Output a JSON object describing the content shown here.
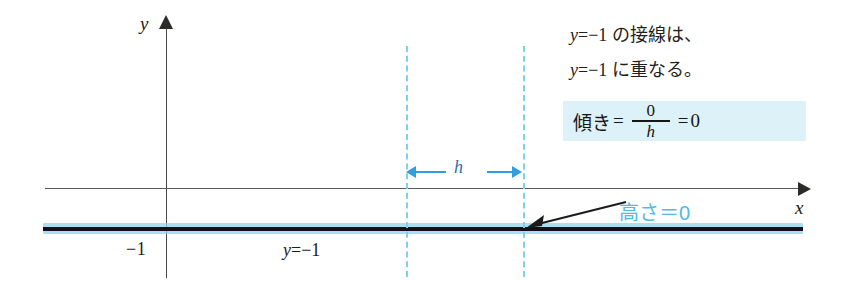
{
  "figure": {
    "axes": {
      "y_label": "y",
      "x_label": "x"
    },
    "tick_labels": {
      "minus_one": "−1"
    },
    "curve_label": {
      "var": "y",
      "rest": "=−1"
    },
    "measure": {
      "h_label": "h"
    },
    "notes": [
      {
        "var": "y",
        "rest": "=−1 の接線は、"
      },
      {
        "var": "y",
        "rest": "=−1 に重なる。"
      }
    ],
    "slope_formula": {
      "lead": "傾き",
      "equals_1": "=",
      "numerator": "0",
      "denominator": "h",
      "equals_2": "=",
      "result": "0"
    },
    "callout": {
      "height_zero": "高さ＝0"
    },
    "colors": {
      "accent_blue": "#53b9e6",
      "dashed_blue": "#7fd0ea",
      "arrow_blue": "#2f9fe0",
      "highlight_bg": "#ddf1f8",
      "curve_black": "#111118",
      "curve_halo": "#8fd3ef",
      "axis_gray": "#5a5a58"
    }
  }
}
